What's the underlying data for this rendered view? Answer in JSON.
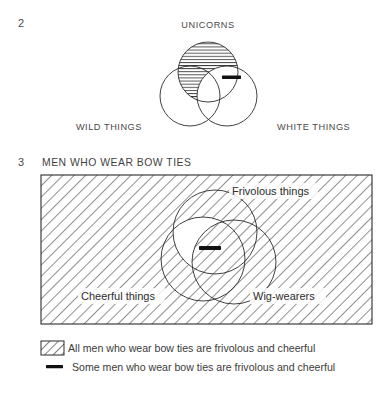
{
  "page": {
    "background": "#ffffff",
    "ink": "#3b3b3b"
  },
  "items": [
    {
      "number": "2",
      "title": "UNICORNS",
      "labels": {
        "top": "UNICORNS",
        "left": "WILD THINGS",
        "right": "WHITE THINGS"
      },
      "shading": "horizontal-hatch",
      "marks": [
        "dash"
      ]
    },
    {
      "number": "3",
      "title": "MEN WHO WEAR BOW TIES",
      "labels": {
        "top": "Frivolous things",
        "left": "Cheerful things",
        "right": "Wig-wearers"
      },
      "shading": "diagonal-hatch",
      "marks": [
        "dash"
      ]
    }
  ],
  "diagram2": {
    "number": "2",
    "top_label": "UNICORNS",
    "left_label": "WILD THINGS",
    "right_label": "WHITE THINGS"
  },
  "diagram3": {
    "number": "3",
    "heading": "MEN WHO WEAR BOW TIES",
    "top_label": "Frivolous things",
    "left_label": "Cheerful things",
    "right_label": "Wig-wearers"
  },
  "legend": {
    "rows": [
      {
        "swatch": "hatch-swatch",
        "text": "All men who wear bow ties are frivolous and cheerful"
      },
      {
        "swatch": "dash-swatch",
        "text": "Some men who wear bow ties are frivolous and cheerful"
      }
    ],
    "row0_text": "All men who wear bow ties are frivolous and cheerful",
    "row1_text": "Some men who wear bow ties are frivolous and cheerful"
  },
  "colors": {
    "stroke": "#2b2b2b",
    "hatch": "#4f4f4f",
    "text": "#3b3b3b",
    "mark": "#111111"
  }
}
